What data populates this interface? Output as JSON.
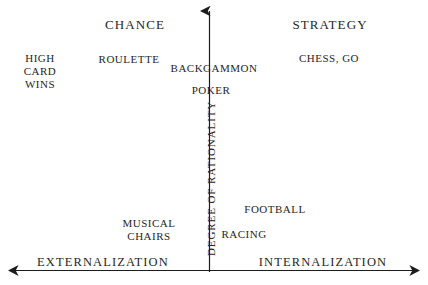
{
  "figure": {
    "type": "quadrant-diagram",
    "background_color": "#ffffff",
    "text_color": "#262626",
    "axis_color": "#1c1c1c"
  },
  "axes": {
    "vertical": {
      "label": "DEGREE OF RATIONALITY",
      "arrow": "up",
      "x": 209,
      "top": 8,
      "bottom": 272
    },
    "horizontal": {
      "left_label": "EXTERNALIZATION",
      "right_label": "INTERNALIZATION",
      "arrows": "both",
      "y": 270,
      "left": 6,
      "right": 422
    }
  },
  "quadrants": {
    "top_left_heading": "CHANCE",
    "top_right_heading": "STRATEGY"
  },
  "items": [
    {
      "label": "HIGH\nCARD\nWINS",
      "x": 40,
      "y": 71
    },
    {
      "label": "ROULETTE",
      "x": 129,
      "y": 59
    },
    {
      "label": "BACKGAMMON",
      "x": 214,
      "y": 68
    },
    {
      "label": "POKER",
      "x": 211,
      "y": 90
    },
    {
      "label": "CHESS, GO",
      "x": 329,
      "y": 58
    },
    {
      "label": "FOOTBALL",
      "x": 275,
      "y": 209
    },
    {
      "label": "MUSICAL\nCHAIRS",
      "x": 149,
      "y": 230
    },
    {
      "label": "RACING",
      "x": 244,
      "y": 234
    }
  ],
  "labels": {
    "chance": "CHANCE",
    "strategy": "STRATEGY",
    "externalization": "EXTERNALIZATION",
    "internalization": "INTERNALIZATION",
    "degree_of_rationality": "DEGREE OF RATIONALITY",
    "high_card_wins": "HIGH\nCARD\nWINS",
    "roulette": "ROULETTE",
    "backgammon": "BACKGAMMON",
    "poker": "POKER",
    "chess_go": "CHESS, GO",
    "football": "FOOTBALL",
    "musical_chairs": "MUSICAL\nCHAIRS",
    "racing": "RACING"
  }
}
